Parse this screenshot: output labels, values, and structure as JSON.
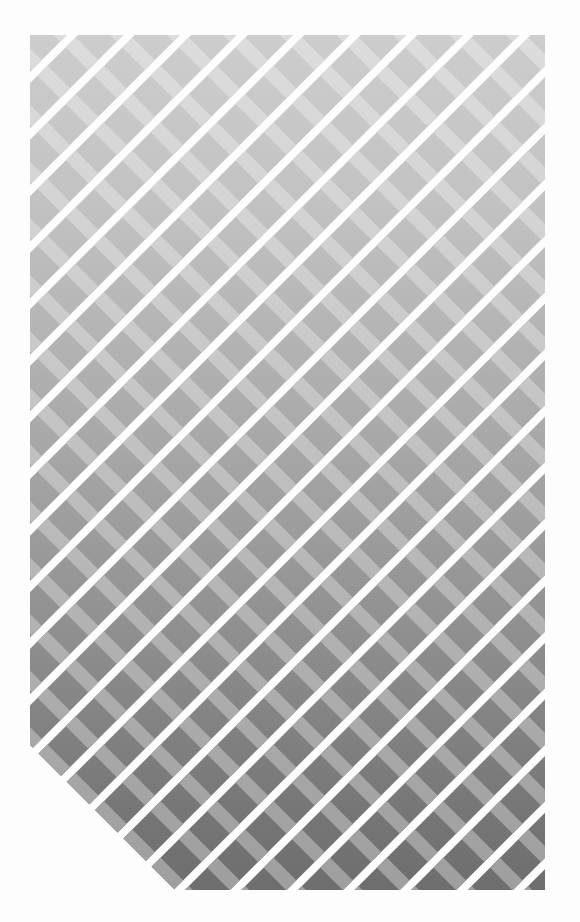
{
  "artwork": {
    "title": "Diagonal Crosshatch Lattice",
    "type": "abstract-geometric-pattern",
    "canvas": {
      "width": 580,
      "height": 922,
      "background_color": "#fdfdfd"
    },
    "pattern_region": {
      "x": 30,
      "y": 35,
      "width": 515,
      "height": 855,
      "corner_clip": "bottom-left-diagonal"
    },
    "primary_stripes": {
      "description": "wide diagonal bands running down-right",
      "angle_degrees": -45,
      "period_px": 40,
      "band_width_px": 32,
      "gap_width_px": 8,
      "gap_color": "#fdfdfd"
    },
    "secondary_stripes": {
      "description": "lighter stripes running up-right crossing the bands",
      "angle_degrees": 45,
      "period_px": 40,
      "stripe_width_px": 14,
      "lighten_amount": "0.28"
    },
    "gradient": {
      "direction": "vertical",
      "stops": [
        {
          "offset": "0%",
          "color": "#cfcfcf",
          "label": "top-light"
        },
        {
          "offset": "22%",
          "color": "#c2c2c2",
          "label": "upper"
        },
        {
          "offset": "45%",
          "color": "#ababab",
          "label": "middle"
        },
        {
          "offset": "68%",
          "color": "#909090",
          "label": "lower-middle"
        },
        {
          "offset": "88%",
          "color": "#767676",
          "label": "lower"
        },
        {
          "offset": "100%",
          "color": "#6a6a6a",
          "label": "bottom-dark"
        }
      ]
    },
    "palette": {
      "background": "#fdfdfd",
      "lightest_band": "#cfcfcf",
      "darkest_band": "#6a6a6a",
      "light_crossing_top": "#dedede",
      "light_crossing_bottom": "#9d9d9d",
      "gap": "#fdfdfd"
    }
  }
}
